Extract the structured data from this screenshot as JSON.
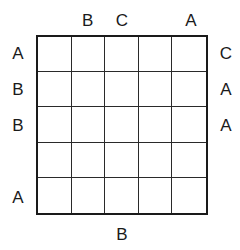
{
  "puzzle": {
    "rows": 5,
    "cols": 5,
    "clues": {
      "top": [
        "",
        "B",
        "C",
        "",
        "A"
      ],
      "bottom": [
        "",
        "",
        "B",
        "",
        ""
      ],
      "left": [
        "A",
        "B",
        "B",
        "",
        "A"
      ],
      "right": [
        "C",
        "A",
        "A",
        "",
        ""
      ]
    },
    "cells": [
      [
        "",
        "",
        "",
        "",
        ""
      ],
      [
        "",
        "",
        "",
        "",
        ""
      ],
      [
        "",
        "",
        "",
        "",
        ""
      ],
      [
        "",
        "",
        "",
        "",
        ""
      ],
      [
        "",
        "",
        "",
        "",
        ""
      ]
    ]
  }
}
